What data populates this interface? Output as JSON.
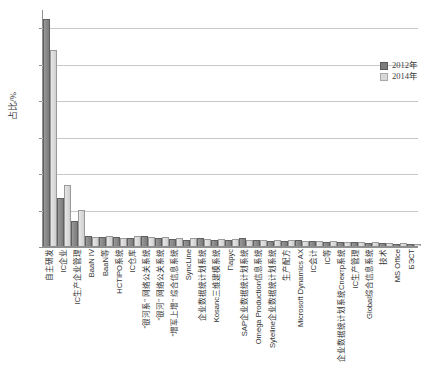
{
  "chart_data": {
    "type": "bar",
    "title": "",
    "xlabel": "",
    "ylabel": "占比/%",
    "ylim": [
      0,
      65
    ],
    "grid": true,
    "legend_position": "top-right",
    "ytick_labels": [
      "0",
      "10",
      "20",
      "30",
      "40",
      "50",
      "60"
    ],
    "ytick_values": [
      0,
      10,
      20,
      30,
      40,
      50,
      60
    ],
    "categories": [
      "自主研发",
      "IC企业",
      "IC生产企业管理",
      "BaaN IV",
      "BaaN等",
      "HCTIPO系统",
      "IC仓库",
      "\"银河系\" 网络公关系统",
      "\"银河\" 网络公关系统",
      "\"增军上增\" 综合信息系统",
      "SyncLine",
      "企业数据统计划系统",
      "Kosanc三维建模系统",
      "Пapyc",
      "SAP企业数据统计划系统",
      "Omega Production信息系统",
      "Syteline企业数据统计划系统",
      "生产配方",
      "Microsoft Dynamics AX",
      "IC会计",
      "IC等",
      "企业数据统计划系统Cпектр系统",
      "IC生产管理",
      "Global综合信息系统",
      "技术",
      "MS Office",
      "БЭСТ"
    ],
    "series": [
      {
        "name": "2012年",
        "color": "#7c7c7c",
        "values": [
          62.0,
          13.0,
          6.5,
          2.6,
          2.3,
          2.2,
          2.0,
          2.6,
          1.9,
          1.7,
          1.5,
          1.9,
          1.5,
          1.4,
          1.9,
          1.3,
          1.2,
          1.1,
          1.5,
          1.0,
          0.9,
          0.8,
          0.7,
          0.6,
          0.5,
          0.4,
          0.4
        ]
      },
      {
        "name": "2014年",
        "color": "#d8d8d8",
        "values": [
          53.5,
          16.5,
          9.5,
          2.3,
          2.6,
          2.0,
          2.4,
          2.2,
          2.2,
          2.0,
          1.8,
          1.6,
          1.7,
          1.6,
          1.5,
          1.5,
          1.4,
          1.3,
          1.2,
          1.1,
          1.0,
          0.9,
          0.8,
          0.7,
          0.6,
          0.5,
          0.4
        ]
      }
    ]
  },
  "legend": {
    "entries": [
      {
        "label": "2012年"
      },
      {
        "label": "2014年"
      }
    ]
  }
}
